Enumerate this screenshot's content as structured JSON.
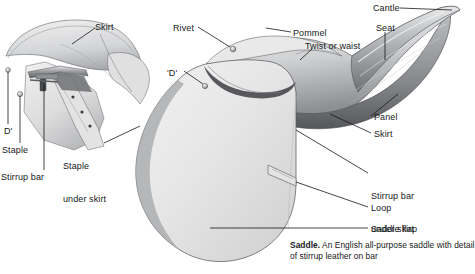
{
  "figure": {
    "caption_lead": "Saddle.",
    "caption_text": " An English all-purpose saddle with detail of stirrup leather on bar",
    "background_color": "#ffffff",
    "ink_color": "#16181a",
    "leather_light": "#ededed",
    "leather_mid": "#d6d6d6",
    "leather_dark": "#8f9093",
    "leather_shadow": "#55575b"
  },
  "inset": {
    "name": "stirrup bar detail inset",
    "labels": [
      {
        "id": "skirt",
        "text": "Skirt",
        "x": 95,
        "y": 22
      },
      {
        "id": "d_ring",
        "text": "D'",
        "x": 4,
        "y": 126
      },
      {
        "id": "staple",
        "text": "Staple",
        "x": 2,
        "y": 145
      },
      {
        "id": "stirrup_bar",
        "text": "Stirrup bar",
        "x": 1,
        "y": 172
      }
    ]
  },
  "main": {
    "name": "saddle main illustration",
    "labels": [
      {
        "id": "rivet",
        "line1": "Rivet",
        "line2": "",
        "x": 173,
        "y": 23
      },
      {
        "id": "pommel",
        "line1": "Pommel",
        "line2": "",
        "x": 293,
        "y": 28
      },
      {
        "id": "twist_or_waist",
        "line1": "Twist or waist",
        "line2": "",
        "x": 305,
        "y": 41
      },
      {
        "id": "cantle",
        "line1": "Cantle",
        "line2": "",
        "x": 373,
        "y": 3
      },
      {
        "id": "seat",
        "line1": "Seat",
        "line2": "",
        "x": 376,
        "y": 23
      },
      {
        "id": "d_ring_main",
        "line1": "'D'",
        "line2": "",
        "x": 167,
        "y": 68
      },
      {
        "id": "panel",
        "line1": "Panel",
        "line2": "",
        "x": 374,
        "y": 112
      },
      {
        "id": "skirt_main",
        "line1": "Skirt",
        "line2": "",
        "x": 374,
        "y": 129
      },
      {
        "id": "staple_under_skirt",
        "line1": "Staple",
        "line2": "under skirt",
        "x": 63,
        "y": 139
      },
      {
        "id": "stirrup_bar_under_skirt",
        "line1": "Stirrup bar",
        "line2": "under skirt",
        "x": 371,
        "y": 169
      },
      {
        "id": "loop",
        "line1": "Loop",
        "line2": "",
        "x": 371,
        "y": 203
      },
      {
        "id": "saddle_flap",
        "line1": "Saddle flap",
        "line2": "",
        "x": 371,
        "y": 224
      }
    ]
  }
}
